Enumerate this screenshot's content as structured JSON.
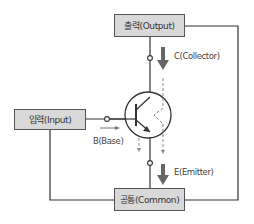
{
  "diagram": {
    "boxes": {
      "output": "출력(Output)",
      "input": "입력(Input)",
      "common": "공통(Common)"
    },
    "labels": {
      "collector": "C(Collector)",
      "base": "B(Base)",
      "emitter": "E(Emitter)"
    },
    "colors": {
      "box_fill": "#d9d9d9",
      "line": "#333333",
      "arrow": "#666666",
      "dashed": "#888888"
    }
  }
}
